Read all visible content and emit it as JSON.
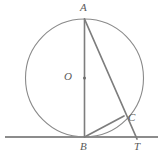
{
  "figure": {
    "canvas": {
      "width": 162,
      "height": 162,
      "background": "#ffffff"
    },
    "colors": {
      "stroke_circle": "#8a8a8a",
      "stroke_line": "#7d7d7d",
      "stroke_tangent": "#8c8c8c",
      "label_text": "#5a5a5a",
      "center_dot": "#6e6e6e"
    },
    "labels": {
      "a": "A",
      "b": "B",
      "c": "C",
      "t": "T",
      "o": "O"
    }
  },
  "chart_data": {
    "type": "diagram",
    "xlabel": "",
    "ylabel": "",
    "grid": false,
    "legend": "none",
    "xlim": [
      0,
      162
    ],
    "ylim": [
      0,
      162
    ],
    "circle": {
      "name": "main-circle",
      "center": {
        "label": "O",
        "x": 84.5,
        "y": 78.0
      },
      "radius": 59.0,
      "stroke": "#8a8a8a",
      "stroke_width": 1.1,
      "fill": "none"
    },
    "points": [
      {
        "label": "A",
        "x": 84.5,
        "y": 19.0,
        "on_circle": true,
        "label_dx": -4,
        "label_dy": -13
      },
      {
        "label": "B",
        "x": 84.5,
        "y": 137.0,
        "on_circle": true,
        "label_dx": -4,
        "label_dy": 4
      },
      {
        "label": "C",
        "x": 124.0,
        "y": 116.0,
        "on_circle": true,
        "label_dx": 5,
        "label_dy": -6
      },
      {
        "label": "T",
        "x": 137.0,
        "y": 137.0,
        "on_circle": false,
        "label_dx": -3,
        "label_dy": 4
      },
      {
        "label": "O",
        "x": 84.5,
        "y": 78.0,
        "on_circle": false,
        "label_dx": -15,
        "label_dy": -6
      }
    ],
    "segments": [
      {
        "name": "diameter-AB",
        "from": "A",
        "to": "B",
        "x1": 84.5,
        "y1": 19.0,
        "x2": 84.5,
        "y2": 137.0,
        "stroke": "#7d7d7d",
        "stroke_width": 1.6
      },
      {
        "name": "secant-AT",
        "from": "A",
        "to": "T",
        "x1": 84.5,
        "y1": 19.0,
        "x2": 137.0,
        "y2": 139.0,
        "stroke": "#7d7d7d",
        "stroke_width": 1.7
      },
      {
        "name": "chord-BC",
        "from": "B",
        "to": "C",
        "x1": 84.5,
        "y1": 137.0,
        "x2": 124.0,
        "y2": 116.0,
        "stroke": "#7d7d7d",
        "stroke_width": 1.7
      },
      {
        "name": "tangent-line",
        "from": "left-edge",
        "to": "right-edge",
        "x1": 5.0,
        "y1": 137.0,
        "x2": 158.0,
        "y2": 137.0,
        "stroke": "#8c8c8c",
        "stroke_width": 2.1
      }
    ],
    "annotations": [
      {
        "text": "A",
        "x": 84.5,
        "y": 8.0
      },
      {
        "text": "O",
        "x": 70.0,
        "y": 78.0
      },
      {
        "text": "C",
        "x": 131.0,
        "y": 118.0
      },
      {
        "text": "B",
        "x": 84.5,
        "y": 148.0
      },
      {
        "text": "T",
        "x": 137.0,
        "y": 148.0
      }
    ]
  }
}
